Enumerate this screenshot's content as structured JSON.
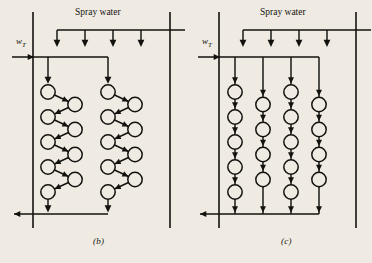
{
  "figure": {
    "background_color": "#efebe3",
    "ink_color": "#14120f",
    "width": 372,
    "height": 263
  },
  "panels": [
    {
      "id": "b",
      "caption": "(b)",
      "caption_x": 93,
      "caption_y": 238,
      "spray_label": "Spray water",
      "spray_label_x": 75,
      "spray_label_y": 8,
      "inlet_label_w": "w",
      "inlet_label_sub": "T",
      "inlet_label_x": 16,
      "inlet_label_y": 41,
      "arrangement": "staggered-zigzag",
      "vessel_left_x": 33,
      "vessel_right_x": 170,
      "vessel_top_y": 12,
      "vessel_bottom_y": 228,
      "spray_header_y": 30,
      "spray_header_x1": 57,
      "spray_header_x2": 185,
      "spray_drop_xs": [
        57,
        85,
        113,
        141
      ],
      "spray_drop_tip_y": 47,
      "inlet_manifold_y": 57,
      "inlet_entry_x": 12,
      "inlet_branch_xs": [
        48,
        108
      ],
      "outlet_manifold_y": 214,
      "outlet_exit_x": 14,
      "banks": [
        {
          "left_col_x": 48,
          "right_col_x": 75,
          "circle_count_left": 5,
          "circle_count_right": 4
        },
        {
          "left_col_x": 108,
          "right_col_x": 135,
          "circle_count_left": 5,
          "circle_count_right": 4
        }
      ],
      "row_start_y": 92,
      "row_pitch": 25,
      "circle_radius": 7.2
    },
    {
      "id": "c",
      "caption": "(c)",
      "caption_x": 281,
      "caption_y": 238,
      "spray_label": "Spray water",
      "spray_label_x": 260,
      "spray_label_y": 8,
      "inlet_label_w": "w",
      "inlet_label_sub": "T",
      "inlet_label_x": 202,
      "inlet_label_y": 41,
      "arrangement": "inline-vertical-columns",
      "vessel_left_x": 219,
      "vessel_right_x": 356,
      "vessel_top_y": 12,
      "vessel_bottom_y": 228,
      "spray_header_y": 30,
      "spray_header_x1": 243,
      "spray_header_x2": 371,
      "spray_drop_xs": [
        243,
        271,
        299,
        327
      ],
      "spray_drop_tip_y": 47,
      "inlet_manifold_y": 57,
      "inlet_entry_x": 198,
      "inlet_branch_xs": [
        235,
        263,
        291,
        319
      ],
      "outlet_manifold_y": 214,
      "outlet_exit_x": 200,
      "columns": [
        {
          "x": 235,
          "circle_count": 5,
          "offset": "high"
        },
        {
          "x": 263,
          "circle_count": 4,
          "offset": "low"
        },
        {
          "x": 291,
          "circle_count": 5,
          "offset": "high"
        },
        {
          "x": 319,
          "circle_count": 4,
          "offset": "low"
        }
      ],
      "row_start_y": 92,
      "row_pitch": 25,
      "circle_radius": 7.2
    }
  ]
}
